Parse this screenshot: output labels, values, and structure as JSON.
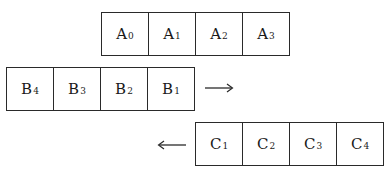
{
  "diagram": {
    "rows": [
      {
        "id": "A",
        "cells": [
          {
            "letter": "A",
            "sub": "0"
          },
          {
            "letter": "A",
            "sub": "1"
          },
          {
            "letter": "A",
            "sub": "2"
          },
          {
            "letter": "A",
            "sub": "3"
          }
        ]
      },
      {
        "id": "B",
        "cells": [
          {
            "letter": "B",
            "sub": "4"
          },
          {
            "letter": "B",
            "sub": "3"
          },
          {
            "letter": "B",
            "sub": "2"
          },
          {
            "letter": "B",
            "sub": "1"
          }
        ],
        "arrow": "right"
      },
      {
        "id": "C",
        "cells": [
          {
            "letter": "C",
            "sub": "1"
          },
          {
            "letter": "C",
            "sub": "2"
          },
          {
            "letter": "C",
            "sub": "3"
          },
          {
            "letter": "C",
            "sub": "4"
          }
        ],
        "arrow": "left"
      }
    ],
    "colors": {
      "line": "#2a2a2a",
      "text": "#1a1a1a",
      "background": "#ffffff"
    }
  }
}
